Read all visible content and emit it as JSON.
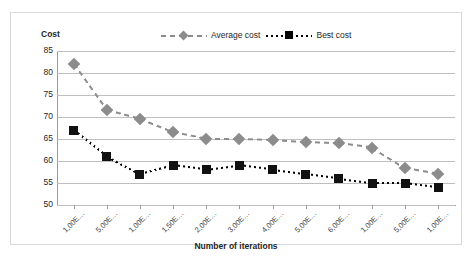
{
  "chart_data": {
    "type": "line",
    "title": "",
    "xlabel": "Number of iterations",
    "ylabel": "Cost",
    "ylim": [
      50,
      85
    ],
    "yticks": [
      50,
      55,
      60,
      65,
      70,
      75,
      80,
      85
    ],
    "grid": true,
    "legend_position": "top",
    "categories": [
      "1,00E…",
      "5,00E…",
      "1,00E…",
      "1,50E…",
      "2,00E…",
      "3,00E…",
      "4,00E…",
      "5,00E…",
      "6,00E…",
      "1,00E…",
      "5,00E…",
      "1,00E…"
    ],
    "series": [
      {
        "name": "Average cost",
        "color": "#8c8c8c",
        "marker": "diamond",
        "linestyle": "dashed",
        "values": [
          82,
          71.5,
          69.5,
          66.5,
          65,
          65,
          64.8,
          64.3,
          64,
          63,
          58.3,
          57
        ]
      },
      {
        "name": "Best cost",
        "color": "#111111",
        "marker": "square",
        "linestyle": "dotted",
        "values": [
          67,
          61,
          57,
          59,
          58,
          59,
          58,
          57,
          56,
          55,
          55,
          54
        ]
      }
    ]
  },
  "axes": {
    "y_title": "Cost",
    "x_title": "Number of iterations"
  },
  "legend": {
    "entries": [
      {
        "label": "Average cost",
        "marker": "diamond-marker",
        "line": "dashed-line"
      },
      {
        "label": "Best cost",
        "marker": "square-marker",
        "line": "dotted-line"
      }
    ]
  }
}
